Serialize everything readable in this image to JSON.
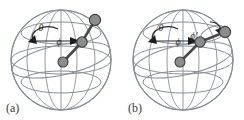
{
  "figure": {
    "background_color": "#ffffff",
    "grid_color": "#8a8f96",
    "outline_color": "#6e747b",
    "bead_fill": "#8c8c8c",
    "bead_stroke": "#3a3a3a",
    "bond_color": "#4a4a4a",
    "arc_color": "#2b2b2b",
    "label_color": "#2b2b2b"
  },
  "panels": [
    {
      "id": "a",
      "caption": "(a)",
      "angles": [
        {
          "name": "theta",
          "symbol": "θ"
        },
        {
          "name": "phi",
          "symbol": "ϕ"
        }
      ],
      "beads": [
        {
          "name": "bead-origin",
          "cx": 63,
          "cy": 62,
          "r": 5.0
        },
        {
          "name": "bead-middle",
          "cx": 82,
          "cy": 42,
          "r": 5.2
        },
        {
          "name": "bead-end",
          "cx": 95,
          "cy": 20,
          "r": 5.6
        }
      ],
      "bonds": [
        {
          "name": "bond-1",
          "x1": 63,
          "y1": 62,
          "x2": 82,
          "y2": 42
        },
        {
          "name": "bond-2",
          "x1": 82,
          "y1": 42,
          "x2": 95,
          "y2": 20
        }
      ],
      "sphere": {
        "cx": 61,
        "cy": 60,
        "rx": 48,
        "ry": 52
      }
    },
    {
      "id": "b",
      "caption": "(b)",
      "angles": [
        {
          "name": "theta",
          "symbol": "θ"
        },
        {
          "name": "phi",
          "symbol": "ϕ"
        },
        {
          "name": "phi-prime",
          "symbol": "ϕ′"
        }
      ],
      "beads": [
        {
          "name": "bead-origin",
          "cx": 58,
          "cy": 62,
          "r": 5.0
        },
        {
          "name": "bead-middle",
          "cx": 78,
          "cy": 42,
          "r": 5.2
        },
        {
          "name": "bead-end",
          "cx": 103,
          "cy": 32,
          "r": 5.6
        }
      ],
      "bonds": [
        {
          "name": "bond-1",
          "x1": 58,
          "y1": 62,
          "x2": 78,
          "y2": 42
        },
        {
          "name": "bond-2",
          "x1": 78,
          "y1": 42,
          "x2": 103,
          "y2": 32
        }
      ],
      "sphere": {
        "cx": 61,
        "cy": 60,
        "rx": 48,
        "ry": 52
      }
    }
  ]
}
